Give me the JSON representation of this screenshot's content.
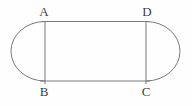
{
  "diagram": {
    "type": "stadium-shape",
    "labels": {
      "top_left": "A",
      "top_right": "D",
      "bottom_left": "B",
      "bottom_right": "C"
    },
    "colors": {
      "line": "#7a7a7a",
      "text": "#3f3f3f",
      "background": "#fefefe"
    }
  }
}
